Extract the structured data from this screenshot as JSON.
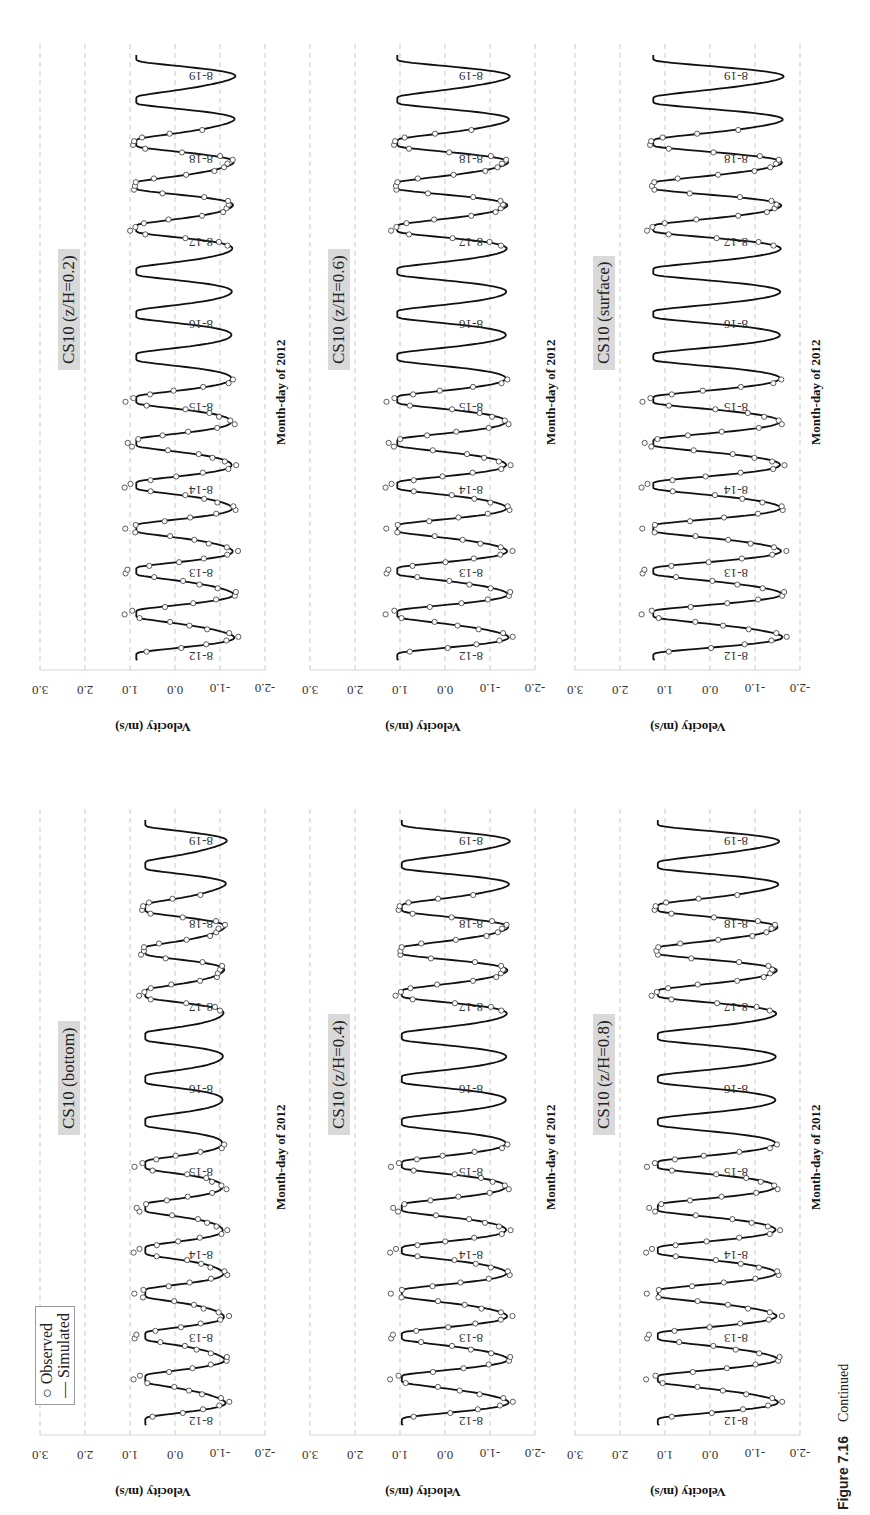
{
  "caption": {
    "label": "Figure 7.16",
    "text": "Continued"
  },
  "legend": {
    "observed": "Observed",
    "simulated": "Simulated"
  },
  "common": {
    "xlabel": "Month-day of 2012",
    "ylabel": "Velocity (m/s)",
    "yticks": [
      "3.0",
      "2.0",
      "1.0",
      "0.0",
      "-1.0",
      "-2.0"
    ],
    "day_labels": [
      "8-12",
      "8-13",
      "8-14",
      "8-15",
      "8-16",
      "8-17",
      "8-18",
      "8-19"
    ]
  },
  "panels": [
    {
      "id": "bottom",
      "title": "CS10 (bottom)"
    },
    {
      "id": "z02",
      "title": "CS10 (z/H=0.2)"
    },
    {
      "id": "z04",
      "title": "CS10 (z/H=0.4)"
    },
    {
      "id": "z06",
      "title": "CS10 (z/H=0.6)"
    },
    {
      "id": "z08",
      "title": "CS10 (z/H=0.8)"
    },
    {
      "id": "surface",
      "title": "CS10 (surface)"
    }
  ],
  "chart_data": [
    {
      "type": "line",
      "title": "CS10 (bottom)",
      "xlabel": "Month-day of 2012",
      "ylabel": "Velocity (m/s)",
      "ylim": [
        -2.0,
        3.0
      ],
      "x_tick_labels": [
        "8-12",
        "8-13",
        "8-14",
        "8-15",
        "8-16",
        "8-17",
        "8-18",
        "8-19"
      ],
      "series": [
        {
          "name": "Simulated",
          "style": "line",
          "description": "semi-diurnal tidal velocity oscillating approx. between -1.2 and +0.8 m/s, two cycles per day"
        },
        {
          "name": "Observed",
          "style": "circles",
          "description": "observations available on 8-12 to 8-15 and 8-17 to 8-18, closely following simulated curve"
        }
      ],
      "sim_amplitude": [
        -1.2,
        0.8
      ],
      "grid": true
    },
    {
      "type": "line",
      "title": "CS10 (z/H=0.2)",
      "xlabel": "Month-day of 2012",
      "ylabel": "Velocity (m/s)",
      "ylim": [
        -2.0,
        3.0
      ],
      "x_tick_labels": [
        "8-12",
        "8-13",
        "8-14",
        "8-15",
        "8-16",
        "8-17",
        "8-18",
        "8-19"
      ],
      "series": [
        {
          "name": "Simulated",
          "style": "line"
        },
        {
          "name": "Observed",
          "style": "circles"
        }
      ],
      "sim_amplitude": [
        -1.4,
        1.0
      ],
      "grid": true
    },
    {
      "type": "line",
      "title": "CS10 (z/H=0.4)",
      "xlabel": "Month-day of 2012",
      "ylabel": "Velocity (m/s)",
      "ylim": [
        -2.0,
        3.0
      ],
      "x_tick_labels": [
        "8-12",
        "8-13",
        "8-14",
        "8-15",
        "8-16",
        "8-17",
        "8-18",
        "8-19"
      ],
      "series": [
        {
          "name": "Simulated",
          "style": "line"
        },
        {
          "name": "Observed",
          "style": "circles"
        }
      ],
      "sim_amplitude": [
        -1.5,
        1.1
      ],
      "grid": true
    },
    {
      "type": "line",
      "title": "CS10 (z/H=0.6)",
      "xlabel": "Month-day of 2012",
      "ylabel": "Velocity (m/s)",
      "ylim": [
        -2.0,
        3.0
      ],
      "x_tick_labels": [
        "8-12",
        "8-13",
        "8-14",
        "8-15",
        "8-16",
        "8-17",
        "8-18",
        "8-19"
      ],
      "series": [
        {
          "name": "Simulated",
          "style": "line"
        },
        {
          "name": "Observed",
          "style": "circles"
        }
      ],
      "sim_amplitude": [
        -1.5,
        1.2
      ],
      "grid": true
    },
    {
      "type": "line",
      "title": "CS10 (z/H=0.8)",
      "xlabel": "Month-day of 2012",
      "ylabel": "Velocity (m/s)",
      "ylim": [
        -2.0,
        3.0
      ],
      "x_tick_labels": [
        "8-12",
        "8-13",
        "8-14",
        "8-15",
        "8-16",
        "8-17",
        "8-18",
        "8-19"
      ],
      "series": [
        {
          "name": "Simulated",
          "style": "line"
        },
        {
          "name": "Observed",
          "style": "circles"
        }
      ],
      "sim_amplitude": [
        -1.6,
        1.3
      ],
      "grid": true
    },
    {
      "type": "line",
      "title": "CS10 (surface)",
      "xlabel": "Month-day of 2012",
      "ylabel": "Velocity (m/s)",
      "ylim": [
        -2.0,
        3.0
      ],
      "x_tick_labels": [
        "8-12",
        "8-13",
        "8-14",
        "8-15",
        "8-16",
        "8-17",
        "8-18",
        "8-19"
      ],
      "series": [
        {
          "name": "Simulated",
          "style": "line"
        },
        {
          "name": "Observed",
          "style": "circles"
        }
      ],
      "sim_amplitude": [
        -1.7,
        1.4
      ],
      "grid": true
    }
  ]
}
